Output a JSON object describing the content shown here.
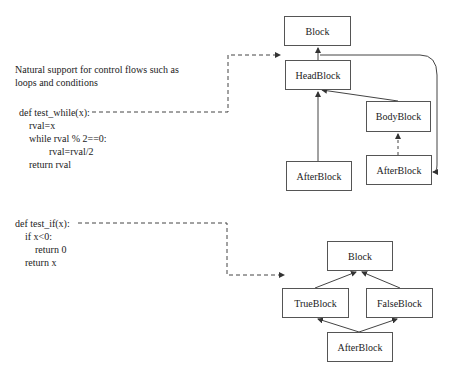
{
  "description": {
    "line1": "Natural support for control flows such as",
    "line2": "loops and conditions"
  },
  "code_while": [
    "def test_while(x):",
    "    rval=x",
    "    while rval % 2==0:",
    "            rval=rval/2",
    "    return rval"
  ],
  "code_if": [
    "def test_if(x):",
    "    if x<0:",
    "        return 0",
    "    return x"
  ],
  "while_diagram": {
    "block": "Block",
    "head": "HeadBlock",
    "body": "BodyBlock",
    "after_left": "AfterBlock",
    "after_right": "AfterBlock"
  },
  "if_diagram": {
    "block": "Block",
    "true": "TrueBlock",
    "false": "FalseBlock",
    "after": "AfterBlock"
  },
  "colors": {
    "line": "#444444",
    "box_border": "#555555",
    "text": "#222222"
  }
}
